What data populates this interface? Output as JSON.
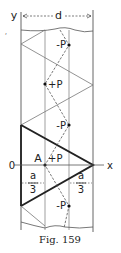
{
  "figure": {
    "caption": "Fig. 159",
    "axis_labels": {
      "y": "y",
      "x": "x",
      "origin": "0"
    },
    "dimension_label": "d",
    "point_label": "A",
    "fraction_left": {
      "numerator": "a",
      "denominator": "3"
    },
    "fraction_right": {
      "numerator": "a",
      "denominator": "3"
    },
    "charges": [
      {
        "label": "-P",
        "x": 69,
        "y": 45
      },
      {
        "label": "+P",
        "x": 45,
        "y": 84
      },
      {
        "label": "-P",
        "x": 69,
        "y": 125
      },
      {
        "label": "+P",
        "x": 45,
        "y": 165
      },
      {
        "label": "-P",
        "x": 69,
        "y": 206
      }
    ]
  }
}
